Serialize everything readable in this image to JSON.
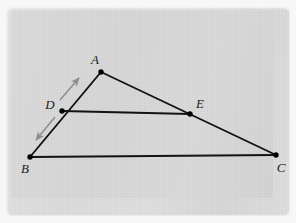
{
  "figure": {
    "kind": "geometry-diagram",
    "background_color": "#dcdcdc",
    "mat_color": "#f7f7f7",
    "line_color": "#121212",
    "arrow_color": "#8d8d8d",
    "point_color": "#000000",
    "label_color": "#1b1b1b"
  },
  "points": [
    {
      "id": "A",
      "label": "A",
      "x": 101,
      "y": 72,
      "label_x": 95,
      "label_y": 64,
      "label_anchor": "middle"
    },
    {
      "id": "B",
      "label": "B",
      "x": 30,
      "y": 157,
      "label_x": 25,
      "label_y": 173,
      "label_anchor": "middle"
    },
    {
      "id": "C",
      "label": "C",
      "x": 276,
      "y": 155,
      "label_x": 281,
      "label_y": 172,
      "label_anchor": "middle"
    },
    {
      "id": "D",
      "label": "D",
      "x": 62,
      "y": 111,
      "label_x": 50,
      "label_y": 109,
      "label_anchor": "middle"
    },
    {
      "id": "E",
      "label": "E",
      "x": 190,
      "y": 114,
      "label_x": 200,
      "label_y": 108,
      "label_anchor": "middle"
    }
  ],
  "segments": [
    {
      "id": "AB",
      "from": "A",
      "to": "B",
      "x1": 101,
      "y1": 72,
      "x2": 30,
      "y2": 157,
      "width": 1.9
    },
    {
      "id": "AC",
      "from": "A",
      "to": "C",
      "x1": 101,
      "y1": 72,
      "x2": 276,
      "y2": 155,
      "width": 1.9
    },
    {
      "id": "BC",
      "from": "B",
      "to": "C",
      "x1": 30,
      "y1": 157,
      "x2": 276,
      "y2": 155,
      "width": 1.9
    },
    {
      "id": "DE",
      "from": "D",
      "to": "E",
      "x1": 62,
      "y1": 111,
      "x2": 190,
      "y2": 114,
      "width": 1.9
    }
  ],
  "arrows": [
    {
      "id": "arrow-toward-A",
      "direction": "up-right",
      "x1": 60,
      "y1": 100,
      "x2": 79,
      "y2": 78,
      "color": "#8d8d8d"
    },
    {
      "id": "arrow-toward-B",
      "direction": "down-left",
      "x1": 55,
      "y1": 117,
      "x2": 36,
      "y2": 140,
      "color": "#8d8d8d"
    }
  ]
}
